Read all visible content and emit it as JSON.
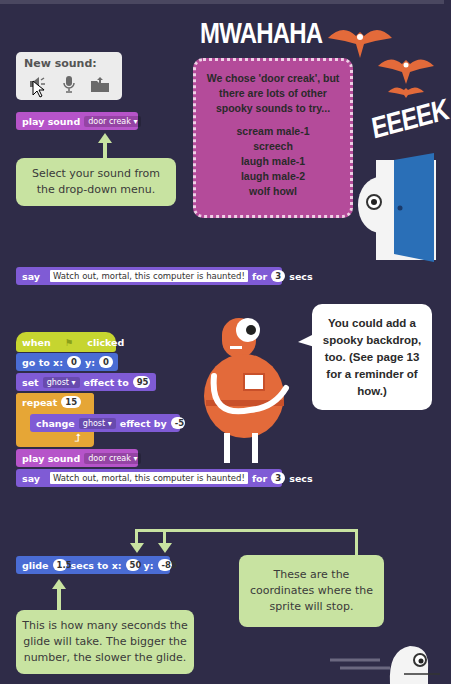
{
  "headline_top": "MWAHAHA",
  "headline_right": "EEEEK",
  "new_sound_panel": {
    "label": "New sound:",
    "icons": [
      "speaker-icon",
      "microphone-icon",
      "upload-folder-icon"
    ]
  },
  "play_sound_block_1": {
    "label": "play sound",
    "dropdown": "door creak"
  },
  "callout_select": "Select your sound from the drop-down menu.",
  "tip_box": {
    "intro": "We chose 'door creak', but there are lots of other spooky sounds to try...",
    "sounds": [
      "scream male-1",
      "screech",
      "laugh male-1",
      "laugh male-2",
      "wolf howl"
    ]
  },
  "say_block_1": {
    "label": "say",
    "text": "Watch out, mortal, this computer is haunted!",
    "for": "for",
    "secs_value": "3",
    "secs": "secs"
  },
  "script": {
    "when": "when",
    "clicked": "clicked",
    "goto": {
      "label": "go to x:",
      "x": "0",
      "ylabel": "y:",
      "y": "0"
    },
    "set": {
      "label": "set",
      "effect": "ghost",
      "to": "effect to",
      "value": "95"
    },
    "repeat": {
      "label": "repeat",
      "value": "15"
    },
    "change": {
      "label": "change",
      "effect": "ghost",
      "by": "effect by",
      "value": "-5"
    },
    "play": {
      "label": "play sound",
      "dropdown": "door creak"
    },
    "say": {
      "label": "say",
      "text": "Watch out, mortal, this computer is haunted!",
      "for": "for",
      "secs_value": "3",
      "secs": "secs"
    }
  },
  "speech_bubble": "You could add a spooky backdrop, too. (See page 13 for a reminder of how.)",
  "glide_block": {
    "label": "glide",
    "secs_value": "1.5",
    "secs_to_x": "secs to x:",
    "x": "50",
    "ylabel": "y:",
    "y": "-85"
  },
  "callout_coords": "These are the coordinates where the sprite will stop.",
  "callout_seconds": "This is how many seconds the glide will take. The bigger the number, the slower the glide."
}
